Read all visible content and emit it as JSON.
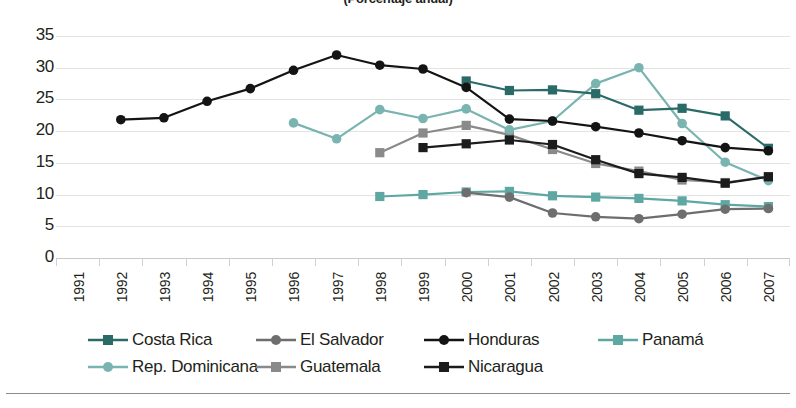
{
  "chart_data": {
    "type": "line",
    "title": "(Porcentaje anual)",
    "xlabel": "",
    "ylabel": "",
    "ylim": [
      0,
      35
    ],
    "ytick_step": 5,
    "yticks": [
      35,
      30,
      25,
      20,
      15,
      10,
      5,
      0
    ],
    "grid": true,
    "legend_position": "bottom",
    "categories": [
      "1991",
      "1992",
      "1993",
      "1994",
      "1995",
      "1996",
      "1997",
      "1998",
      "1999",
      "2000",
      "2001",
      "2002",
      "2003",
      "2004",
      "2005",
      "2006",
      "2007"
    ],
    "series": [
      {
        "name": "Costa Rica",
        "color": "#2a6b68",
        "marker": "square",
        "values": [
          null,
          null,
          null,
          null,
          null,
          null,
          null,
          null,
          null,
          27.9,
          26.4,
          26.5,
          25.9,
          23.3,
          23.6,
          22.4,
          17.3
        ]
      },
      {
        "name": "El Salvador",
        "color": "#6e6e6e",
        "marker": "circle",
        "values": [
          null,
          null,
          null,
          null,
          null,
          null,
          null,
          null,
          null,
          10.3,
          9.6,
          7.1,
          6.5,
          6.2,
          6.9,
          7.7,
          7.8
        ]
      },
      {
        "name": "Honduras",
        "color": "#141414",
        "marker": "circle",
        "values": [
          null,
          21.8,
          22.1,
          24.7,
          26.7,
          29.6,
          32.0,
          30.4,
          29.8,
          26.9,
          21.9,
          21.6,
          20.7,
          19.7,
          18.5,
          17.4,
          16.9
        ]
      },
      {
        "name": "Panamá",
        "color": "#5ea7a2",
        "marker": "square",
        "values": [
          null,
          null,
          null,
          null,
          null,
          null,
          null,
          9.7,
          10.0,
          10.4,
          10.5,
          9.8,
          9.6,
          9.4,
          9.0,
          8.4,
          8.1
        ]
      },
      {
        "name": "Rep. Dominicana",
        "color": "#79b4b0",
        "marker": "circle",
        "values": [
          null,
          null,
          null,
          null,
          null,
          21.3,
          18.8,
          23.4,
          22.0,
          23.5,
          20.2,
          21.6,
          27.5,
          30.0,
          21.2,
          15.1,
          12.2
        ]
      },
      {
        "name": "Guatemala",
        "color": "#8a8a8a",
        "marker": "square",
        "values": [
          null,
          null,
          null,
          null,
          null,
          null,
          null,
          16.6,
          19.7,
          20.9,
          19.4,
          17.1,
          14.9,
          13.7,
          12.3,
          11.9,
          12.8
        ]
      },
      {
        "name": "Nicaragua",
        "color": "#1c1c1c",
        "marker": "square",
        "values": [
          null,
          null,
          null,
          null,
          null,
          null,
          null,
          null,
          17.4,
          18.0,
          18.6,
          17.9,
          15.5,
          13.3,
          12.7,
          11.8,
          12.8
        ]
      }
    ]
  },
  "legend": {
    "rows": [
      [
        {
          "label": "Costa Rica"
        },
        {
          "label": "El Salvador"
        },
        {
          "label": "Honduras"
        },
        {
          "label": "Panamá"
        }
      ],
      [
        {
          "label": "Rep. Dominicana"
        },
        {
          "label": "Guatemala"
        },
        {
          "label": "Nicaragua"
        }
      ]
    ]
  }
}
